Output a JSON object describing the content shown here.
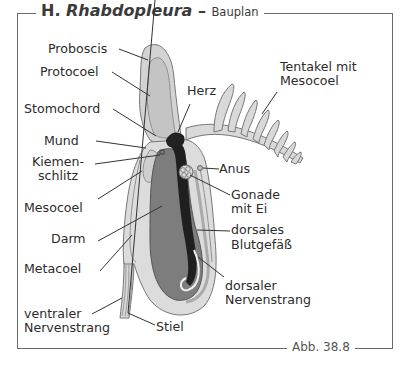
{
  "figure": {
    "title_prefix": "H.",
    "title_genus": "Rhabdopleura",
    "title_dash": "–",
    "title_sub": "Bauplan",
    "figure_number": "Abb. 38.8"
  },
  "labels": {
    "proboscis": "Proboscis",
    "protocoel": "Protocoel",
    "stomochord": "Stomochord",
    "mund": "Mund",
    "kiemenschlitz_1": "Kiemen-",
    "kiemenschlitz_2": "schlitz",
    "mesocoel": "Mesocoel",
    "darm": "Darm",
    "metacoel": "Metacoel",
    "ventraler_1": "ventraler",
    "ventraler_2": "Nervenstrang",
    "stiel": "Stiel",
    "herz": "Herz",
    "tentakel_1": "Tentakel mit",
    "tentakel_2": "Mesocoel",
    "anus": "Anus",
    "gonade_1": "Gonade",
    "gonade_2": "mit Ei",
    "blutgefaess_1": "dorsales",
    "blutgefaess_2": "Blutgefäß",
    "dorsaler_1": "dorsaler",
    "dorsaler_2": "Nervenstrang"
  },
  "colors": {
    "frame": "#6a6a6a",
    "light_tissue": "#d9d9d9",
    "mid_tissue": "#bdbdbd",
    "gut": "#7d7d7d",
    "dark_vessel": "#1f1f1f"
  }
}
